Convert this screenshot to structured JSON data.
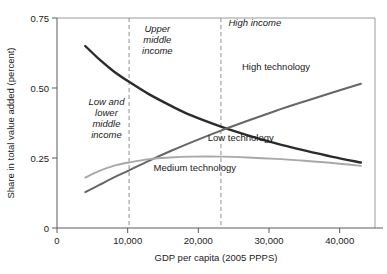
{
  "chart_data": {
    "type": "line",
    "title": "",
    "xlabel": "GDP per capita (2005 PPPS)",
    "ylabel": "Share in total value added (percent)",
    "xlim": [
      0,
      45000
    ],
    "ylim": [
      0,
      0.75
    ],
    "grid": false,
    "legend_position": "inline-labels",
    "xticks": [
      "0",
      "10,000",
      "20,000",
      "30,000",
      "40,000"
    ],
    "xtick_values": [
      0,
      10000,
      20000,
      30000,
      40000
    ],
    "yticks": [
      "0",
      "0.25",
      "0.50",
      "0.75"
    ],
    "ytick_values": [
      0,
      0.25,
      0.5,
      0.75
    ],
    "annotations": [
      {
        "name": "low-and-lower-middle-income",
        "text": "Low and lower middle income",
        "x": 7000,
        "y": 0.44
      },
      {
        "name": "upper-middle-income",
        "text": "Upper middle income",
        "x": 14200,
        "y": 0.7
      },
      {
        "name": "high-income",
        "text": "High income",
        "x": 28000,
        "y": 0.72
      }
    ],
    "dividers": [
      {
        "name": "lower-middle-to-upper-middle",
        "x": 10200
      },
      {
        "name": "upper-middle-to-high",
        "x": 23200
      }
    ],
    "series": [
      {
        "name": "Low technology",
        "color": "#2b2b2b",
        "label_x": 26000,
        "label_y": 0.31,
        "x": [
          4000,
          6000,
          8000,
          10200,
          13000,
          16000,
          19000,
          23200,
          27000,
          31000,
          35000,
          39000,
          43000
        ],
        "values": [
          0.65,
          0.602,
          0.56,
          0.522,
          0.478,
          0.438,
          0.402,
          0.362,
          0.331,
          0.302,
          0.277,
          0.254,
          0.234
        ]
      },
      {
        "name": "High technology",
        "color": "#666666",
        "label_x": 31000,
        "label_y": 0.565,
        "x": [
          4000,
          6000,
          8000,
          10200,
          13000,
          16000,
          19000,
          23200,
          27000,
          31000,
          35000,
          39000,
          43000
        ],
        "values": [
          0.128,
          0.154,
          0.18,
          0.206,
          0.24,
          0.274,
          0.306,
          0.348,
          0.383,
          0.419,
          0.452,
          0.484,
          0.515
        ]
      },
      {
        "name": "Medium technology",
        "color": "#a8a8a8",
        "label_x": 19500,
        "label_y": 0.205,
        "x": [
          4000,
          6000,
          8000,
          10200,
          13000,
          16000,
          19000,
          23200,
          27000,
          31000,
          35000,
          39000,
          43000
        ],
        "values": [
          0.18,
          0.204,
          0.222,
          0.234,
          0.246,
          0.252,
          0.255,
          0.255,
          0.252,
          0.247,
          0.24,
          0.232,
          0.222
        ]
      }
    ]
  }
}
